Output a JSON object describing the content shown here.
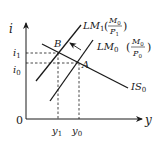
{
  "diagram": {
    "axes": {
      "y_label": "i",
      "x_label": "y",
      "origin_label": "0"
    },
    "curves": [
      {
        "id": "LM1",
        "name": "LM",
        "sub": "1",
        "paren_num": "M",
        "paren_num_sub": "0",
        "paren_den": "P",
        "paren_den_sub": "1"
      },
      {
        "id": "LM0",
        "name": "LM",
        "sub": "0",
        "paren_num": "M",
        "paren_num_sub": "0",
        "paren_den": "P",
        "paren_den_sub": "0"
      },
      {
        "id": "IS0",
        "name": "IS",
        "sub": "0"
      }
    ],
    "points": [
      {
        "id": "B",
        "label": "B"
      },
      {
        "id": "A",
        "label": "A"
      }
    ],
    "ticks": {
      "i1": {
        "name": "i",
        "sub": "1"
      },
      "i0": {
        "name": "i",
        "sub": "0"
      },
      "y1": {
        "name": "y",
        "sub": "1"
      },
      "y0": {
        "name": "y",
        "sub": "0"
      }
    },
    "colors": {
      "line": "#1a1a1a",
      "background": "#ffffff"
    }
  }
}
